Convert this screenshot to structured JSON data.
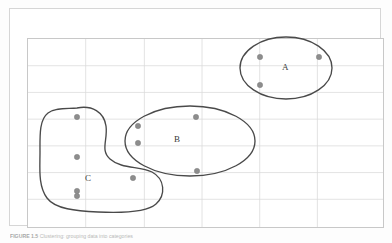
{
  "figure": {
    "caption_label": "FIGURE 1.5",
    "caption_text": "Clustering: grouping data into categories",
    "background_color": "#ffffff",
    "frame_color": "#d6d6d6",
    "grid_color": "#d9d9d9",
    "outline_color": "#4a4a4a",
    "point_color": "#8d8d8d"
  },
  "grid": {
    "columns": 6,
    "rows": 7,
    "x_lines": [
      17,
      75,
      134,
      192,
      250,
      308,
      374
    ],
    "y_lines": [
      29,
      56,
      83,
      110,
      137,
      164,
      191,
      219
    ],
    "show_grid": true
  },
  "clusters": [
    {
      "id": "A",
      "label": "A",
      "label_x": 285,
      "label_y": 68,
      "shape": "ellipse",
      "cx": 286,
      "cy": 68,
      "rx": 46,
      "ry": 31,
      "points": [
        {
          "x": 260,
          "y": 57
        },
        {
          "x": 319,
          "y": 57
        },
        {
          "x": 260,
          "y": 85
        }
      ]
    },
    {
      "id": "B",
      "label": "B",
      "label_x": 177,
      "label_y": 140,
      "shape": "ellipse",
      "cx": 190,
      "cy": 141,
      "rx": 65,
      "ry": 35,
      "points": [
        {
          "x": 196,
          "y": 117
        },
        {
          "x": 138,
          "y": 126
        },
        {
          "x": 138,
          "y": 143
        },
        {
          "x": 197,
          "y": 171
        }
      ]
    },
    {
      "id": "C",
      "label": "C",
      "label_x": 88,
      "label_y": 179,
      "shape": "blob",
      "points": [
        {
          "x": 77,
          "y": 117
        },
        {
          "x": 77,
          "y": 157
        },
        {
          "x": 77,
          "y": 191
        },
        {
          "x": 77,
          "y": 196
        },
        {
          "x": 133,
          "y": 178
        }
      ]
    }
  ],
  "chart_data": {
    "type": "scatter",
    "title": "",
    "xlabel": "",
    "ylabel": "",
    "grid": true,
    "legend": "none",
    "series": [
      {
        "name": "A",
        "values": [
          [
            260,
            57
          ],
          [
            319,
            57
          ],
          [
            260,
            85
          ]
        ]
      },
      {
        "name": "B",
        "values": [
          [
            196,
            117
          ],
          [
            138,
            126
          ],
          [
            138,
            143
          ],
          [
            197,
            171
          ]
        ]
      },
      {
        "name": "C",
        "values": [
          [
            77,
            117
          ],
          [
            77,
            157
          ],
          [
            77,
            191
          ],
          [
            77,
            196
          ],
          [
            133,
            178
          ]
        ]
      }
    ]
  }
}
